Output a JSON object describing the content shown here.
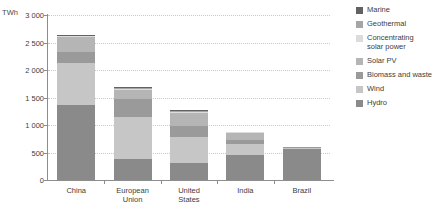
{
  "chart_data": {
    "type": "bar",
    "stacked": true,
    "title": "",
    "subtitle": "",
    "xlabel": "",
    "ylabel": "TWh",
    "ylim": [
      0,
      3000
    ],
    "ytick_step": 500,
    "ytick_labels": [
      "3 000",
      "2 500",
      "2 000",
      "1 500",
      "1 000",
      "500",
      "0"
    ],
    "ytick_values": [
      3000,
      2500,
      2000,
      1500,
      1000,
      500,
      0
    ],
    "grid": true,
    "legend_position": "right",
    "categories": [
      "China",
      "European\nUnion",
      "United\nStates",
      "India",
      "Brazil"
    ],
    "series": [
      {
        "name": "Hydro",
        "color": "#8a8a8a",
        "values": [
          1370,
          390,
          310,
          450,
          570
        ]
      },
      {
        "name": "Wind",
        "color": "#c6c6c6",
        "values": [
          760,
          760,
          480,
          200,
          25
        ]
      },
      {
        "name": "Biomass and waste",
        "color": "#9a9a9a",
        "values": [
          190,
          320,
          190,
          70,
          10
        ]
      },
      {
        "name": "Solar PV",
        "color": "#b5b5b5",
        "values": [
          290,
          175,
          230,
          150,
          0
        ]
      },
      {
        "name": "Concentrating\nsolar power",
        "color": "#dcdcdc",
        "values": [
          10,
          20,
          25,
          5,
          0
        ]
      },
      {
        "name": "Geothermal",
        "color": "#a5a5a5",
        "values": [
          10,
          15,
          25,
          0,
          0
        ]
      },
      {
        "name": "Marine",
        "color": "#626262",
        "values": [
          5,
          5,
          5,
          0,
          0
        ]
      }
    ],
    "totals": [
      2635,
      1685,
      1265,
      875,
      605
    ]
  },
  "legend": {
    "items": [
      {
        "label": "Marine",
        "color": "#626262"
      },
      {
        "label": "Geothermal",
        "color": "#a5a5a5"
      },
      {
        "label": "Concentrating\nsolar power",
        "color": "#dcdcdc"
      },
      {
        "label": "Solar PV",
        "color": "#b5b5b5"
      },
      {
        "label": "Biomass and waste",
        "color": "#9a9a9a"
      },
      {
        "label": "Wind",
        "color": "#c6c6c6"
      },
      {
        "label": "Hydro",
        "color": "#8a8a8a"
      }
    ]
  },
  "axes": {
    "y_title": "TWh"
  }
}
